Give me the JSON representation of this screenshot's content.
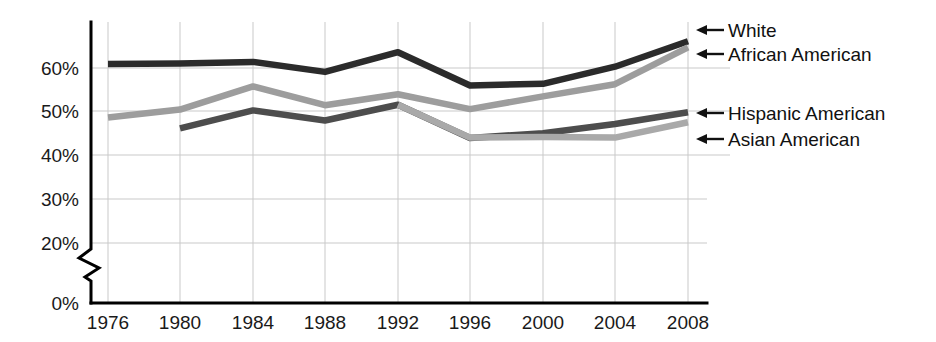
{
  "chart_data": {
    "type": "line",
    "title": "",
    "subtitle": "",
    "xlabel": "",
    "ylabel": "",
    "x": [
      1976,
      1980,
      1984,
      1988,
      1992,
      1996,
      2000,
      2004,
      2008
    ],
    "categories": [
      "1976",
      "1980",
      "1984",
      "1988",
      "1992",
      "1996",
      "2000",
      "2004",
      "2008"
    ],
    "xlim": [
      1976,
      2008
    ],
    "ylim": [
      0,
      70
    ],
    "y_ticks": [
      0,
      20,
      30,
      40,
      50,
      60
    ],
    "y_tick_labels": [
      "0%",
      "20%",
      "30%",
      "40%",
      "50%",
      "60%"
    ],
    "axis_break": true,
    "axis_break_between": [
      0,
      20
    ],
    "grid": true,
    "legend_position": "right-inline-arrows",
    "series": [
      {
        "name": "White",
        "color": "#2b2b2b",
        "x": [
          1976,
          1980,
          1984,
          1988,
          1992,
          1996,
          2000,
          2004,
          2008
        ],
        "values": [
          60.9,
          61.0,
          61.4,
          59.1,
          63.6,
          56.0,
          56.4,
          60.3,
          66.1
        ]
      },
      {
        "name": "African American",
        "color": "#9d9d9d",
        "x": [
          1976,
          1980,
          1984,
          1988,
          1992,
          1996,
          2000,
          2004,
          2008
        ],
        "values": [
          48.7,
          50.5,
          55.8,
          51.5,
          54.0,
          50.6,
          53.5,
          56.3,
          64.7
        ]
      },
      {
        "name": "Hispanic American",
        "color": "#4d4d4d",
        "x": [
          1980,
          1984,
          1988,
          1992,
          1996,
          2000,
          2004,
          2008
        ],
        "values": [
          46.2,
          50.3,
          48.0,
          51.6,
          44.0,
          45.1,
          47.2,
          49.9
        ]
      },
      {
        "name": "Asian American",
        "color": "#a9a9a9",
        "x": [
          1992,
          1996,
          2000,
          2004,
          2008
        ],
        "values": [
          51.6,
          44.1,
          44.2,
          44.1,
          47.6
        ]
      }
    ]
  },
  "y_axis": {
    "ticks": [
      {
        "label": "60%",
        "value": 60
      },
      {
        "label": "50%",
        "value": 50
      },
      {
        "label": "40%",
        "value": 40
      },
      {
        "label": "30%",
        "value": 30
      },
      {
        "label": "20%",
        "value": 20
      },
      {
        "label": "0%",
        "value": 0
      }
    ]
  },
  "x_axis": {
    "ticks": [
      {
        "label": "1976"
      },
      {
        "label": "1980"
      },
      {
        "label": "1984"
      },
      {
        "label": "1988"
      },
      {
        "label": "1992"
      },
      {
        "label": "1996"
      },
      {
        "label": "2000"
      },
      {
        "label": "2004"
      },
      {
        "label": "2008"
      }
    ]
  },
  "legend": {
    "items": [
      {
        "label": "White",
        "color": "#2b2b2b"
      },
      {
        "label": "African American",
        "color": "#9d9d9d"
      },
      {
        "label": "Hispanic American",
        "color": "#4d4d4d"
      },
      {
        "label": "Asian American",
        "color": "#a9a9a9"
      }
    ]
  }
}
